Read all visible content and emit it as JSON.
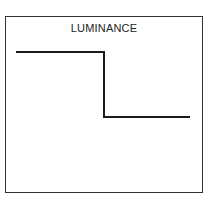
{
  "diagram": {
    "title": "LUMINANCE",
    "profile": {
      "type": "step",
      "description": "High luminance on left, sharp drop to low luminance on right",
      "points": [
        [
          16,
          52
        ],
        [
          104,
          52
        ],
        [
          104,
          117
        ],
        [
          190,
          117
        ]
      ],
      "stroke_color": "#1a1a1a"
    },
    "frame_color": "#333333"
  }
}
